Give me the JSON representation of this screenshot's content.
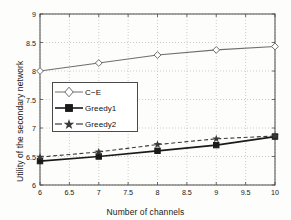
{
  "chart_data": {
    "type": "line",
    "title": "",
    "xlabel": "Number of channels",
    "ylabel": "Utility of the secondary network",
    "x": [
      6,
      7,
      8,
      9,
      10
    ],
    "xlim": [
      6,
      10
    ],
    "ylim": [
      6,
      9
    ],
    "xticks": [
      "6",
      "6.5",
      "7",
      "7.5",
      "8",
      "8.5",
      "9",
      "9.5",
      "10"
    ],
    "xtick_values": [
      6,
      6.5,
      7,
      7.5,
      8,
      8.5,
      9,
      9.5,
      10
    ],
    "yticks": [
      "6",
      "6.5",
      "7",
      "7.5",
      "8",
      "8.5",
      "9"
    ],
    "ytick_values": [
      6,
      6.5,
      7,
      7.5,
      8,
      8.5,
      9
    ],
    "grid": true,
    "legend_position": "center-left",
    "series": [
      {
        "name": "C−E",
        "values": [
          8.0,
          8.14,
          8.28,
          8.37,
          8.43
        ],
        "marker": "diamond",
        "linestyle": "solid",
        "color": "#6e6e6e"
      },
      {
        "name": "Greedy1",
        "values": [
          6.42,
          6.5,
          6.6,
          6.7,
          6.85
        ],
        "marker": "square",
        "linestyle": "solid",
        "color": "#1a1a1a"
      },
      {
        "name": "Greedy2",
        "values": [
          6.49,
          6.58,
          6.71,
          6.81,
          6.86
        ],
        "marker": "star",
        "linestyle": "dashed",
        "color": "#3a3a3a"
      }
    ]
  },
  "axes": {
    "plot_left_px": 40,
    "plot_right_px": 275,
    "plot_top_px": 14,
    "plot_bottom_px": 185
  },
  "colors": {
    "background": "#fdfdfb",
    "axis": "#4a4a4a",
    "grid": "#b8b8b8",
    "text": "#1a1a1a"
  }
}
